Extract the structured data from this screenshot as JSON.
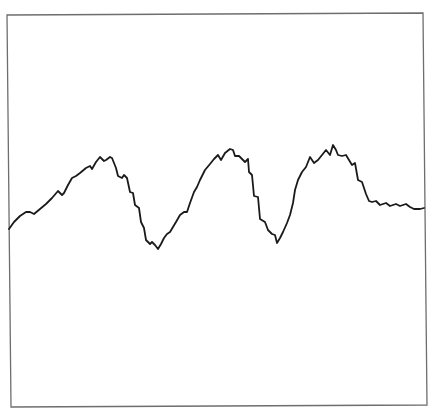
{
  "chart_data": {
    "type": "line",
    "title": "",
    "xlabel": "",
    "ylabel": "",
    "grid": false,
    "legend": null,
    "axes_ticks": false,
    "frame": {
      "corners": [
        [
          7,
          15
        ],
        [
          423,
          13
        ],
        [
          427,
          405
        ],
        [
          11,
          407
        ]
      ],
      "color": "#6e6e6e"
    },
    "series": [
      {
        "name": "signal",
        "color": "#1a1a1a",
        "points": [
          [
            9,
            229
          ],
          [
            14,
            222
          ],
          [
            20,
            216
          ],
          [
            26,
            212
          ],
          [
            30,
            212
          ],
          [
            34,
            214
          ],
          [
            40,
            209
          ],
          [
            46,
            204
          ],
          [
            52,
            198
          ],
          [
            58,
            191
          ],
          [
            62,
            195
          ],
          [
            64,
            193
          ],
          [
            68,
            185
          ],
          [
            72,
            178
          ],
          [
            76,
            176
          ],
          [
            80,
            173
          ],
          [
            86,
            168
          ],
          [
            90,
            166
          ],
          [
            92,
            169
          ],
          [
            96,
            162
          ],
          [
            100,
            157
          ],
          [
            104,
            161
          ],
          [
            106,
            160
          ],
          [
            110,
            157
          ],
          [
            112,
            158
          ],
          [
            116,
            168
          ],
          [
            118,
            176
          ],
          [
            122,
            178
          ],
          [
            124,
            175
          ],
          [
            127,
            178
          ],
          [
            130,
            192
          ],
          [
            133,
            193
          ],
          [
            135,
            205
          ],
          [
            139,
            208
          ],
          [
            141,
            222
          ],
          [
            144,
            228
          ],
          [
            146,
            240
          ],
          [
            150,
            244
          ],
          [
            152,
            242
          ],
          [
            155,
            245
          ],
          [
            158,
            249
          ],
          [
            161,
            244
          ],
          [
            164,
            238
          ],
          [
            167,
            234
          ],
          [
            170,
            232
          ],
          [
            176,
            222
          ],
          [
            180,
            215
          ],
          [
            184,
            212
          ],
          [
            187,
            212
          ],
          [
            190,
            203
          ],
          [
            194,
            192
          ],
          [
            197,
            187
          ],
          [
            200,
            180
          ],
          [
            205,
            170
          ],
          [
            210,
            164
          ],
          [
            214,
            159
          ],
          [
            218,
            155
          ],
          [
            221,
            160
          ],
          [
            225,
            153
          ],
          [
            230,
            149
          ],
          [
            233,
            150
          ],
          [
            235,
            156
          ],
          [
            239,
            156
          ],
          [
            242,
            159
          ],
          [
            245,
            162
          ],
          [
            248,
            159
          ],
          [
            249,
            172
          ],
          [
            252,
            175
          ],
          [
            254,
            196
          ],
          [
            258,
            197
          ],
          [
            260,
            219
          ],
          [
            265,
            222
          ],
          [
            268,
            230
          ],
          [
            272,
            234
          ],
          [
            275,
            235
          ],
          [
            277,
            243
          ],
          [
            280,
            238
          ],
          [
            283,
            232
          ],
          [
            287,
            223
          ],
          [
            290,
            215
          ],
          [
            293,
            203
          ],
          [
            295,
            190
          ],
          [
            298,
            180
          ],
          [
            302,
            172
          ],
          [
            306,
            167
          ],
          [
            310,
            157
          ],
          [
            314,
            163
          ],
          [
            318,
            160
          ],
          [
            322,
            155
          ],
          [
            326,
            150
          ],
          [
            330,
            155
          ],
          [
            333,
            145
          ],
          [
            336,
            150
          ],
          [
            338,
            155
          ],
          [
            342,
            156
          ],
          [
            346,
            155
          ],
          [
            349,
            160
          ],
          [
            352,
            165
          ],
          [
            355,
            163
          ],
          [
            358,
            180
          ],
          [
            362,
            182
          ],
          [
            366,
            194
          ],
          [
            369,
            201
          ],
          [
            372,
            202
          ],
          [
            376,
            201
          ],
          [
            380,
            205
          ],
          [
            386,
            203
          ],
          [
            390,
            206
          ],
          [
            396,
            204
          ],
          [
            400,
            206
          ],
          [
            406,
            204
          ],
          [
            410,
            207
          ],
          [
            414,
            209
          ],
          [
            420,
            209
          ],
          [
            424,
            208
          ]
        ]
      }
    ]
  }
}
